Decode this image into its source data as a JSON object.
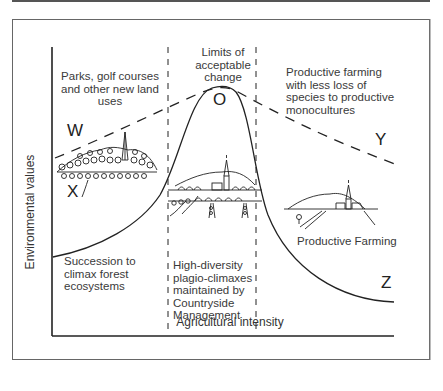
{
  "figure": {
    "axes": {
      "y_label": "Environmental values",
      "x_label": "Agricultural intensity"
    },
    "zones": {
      "left_top": "Parks, golf courses and other new land uses",
      "middle_top": "Limits of acceptable change",
      "right_top": "Productive farming with less loss of species to productive monocultures",
      "left_bottom": "Succession to climax forest ecosystems",
      "middle_bottom": "High-diversity plagio-climaxes maintained by Countryside Management",
      "right_bottom": "Productive Farming"
    },
    "point_labels": {
      "W": "W",
      "X": "X",
      "O": "O",
      "Y": "Y",
      "Z": "Z"
    },
    "illustrations": [
      "forested-hill-with-church",
      "village-with-church-and-trees",
      "farm-with-church-on-hill"
    ]
  }
}
